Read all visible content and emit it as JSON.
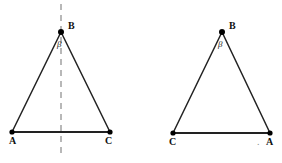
{
  "figure": {
    "background_color": "#ffffff",
    "stroke_color": "#222222",
    "dash_color": "#9b9b9b",
    "vertex_dot_color": "#000000",
    "width": 282,
    "height": 163,
    "triangles": [
      {
        "id": "left-triangle",
        "name": "isosceles-triangle-with-axis",
        "vertices": [
          {
            "label": "A",
            "x": 12,
            "y": 132,
            "label_x": 9,
            "label_y": 138
          },
          {
            "label": "C",
            "x": 110,
            "y": 132,
            "label_x": 106,
            "label_y": 138
          },
          {
            "label": "B",
            "x": 61,
            "y": 32,
            "label_x": 68,
            "label_y": 22
          }
        ],
        "angle": {
          "symbol": "β",
          "x": 58,
          "y": 41
        },
        "axis": {
          "x": 61,
          "y_top": 4,
          "y_bottom": 158,
          "style": "dashed"
        }
      },
      {
        "id": "right-triangle",
        "name": "isosceles-triangle-plain",
        "vertices": [
          {
            "label": "C",
            "x": 173,
            "y": 133,
            "label_x": 169,
            "label_y": 139
          },
          {
            "label": "A",
            "x": 270,
            "y": 133,
            "label_x": 267,
            "label_y": 139
          },
          {
            "label": "B",
            "x": 222,
            "y": 32,
            "label_x": 229,
            "label_y": 22
          }
        ],
        "angle": {
          "symbol": "β",
          "x": 219,
          "y": 41
        },
        "stray_mark": {
          "symbol": ".",
          "x": 258,
          "y": 138
        }
      }
    ]
  }
}
